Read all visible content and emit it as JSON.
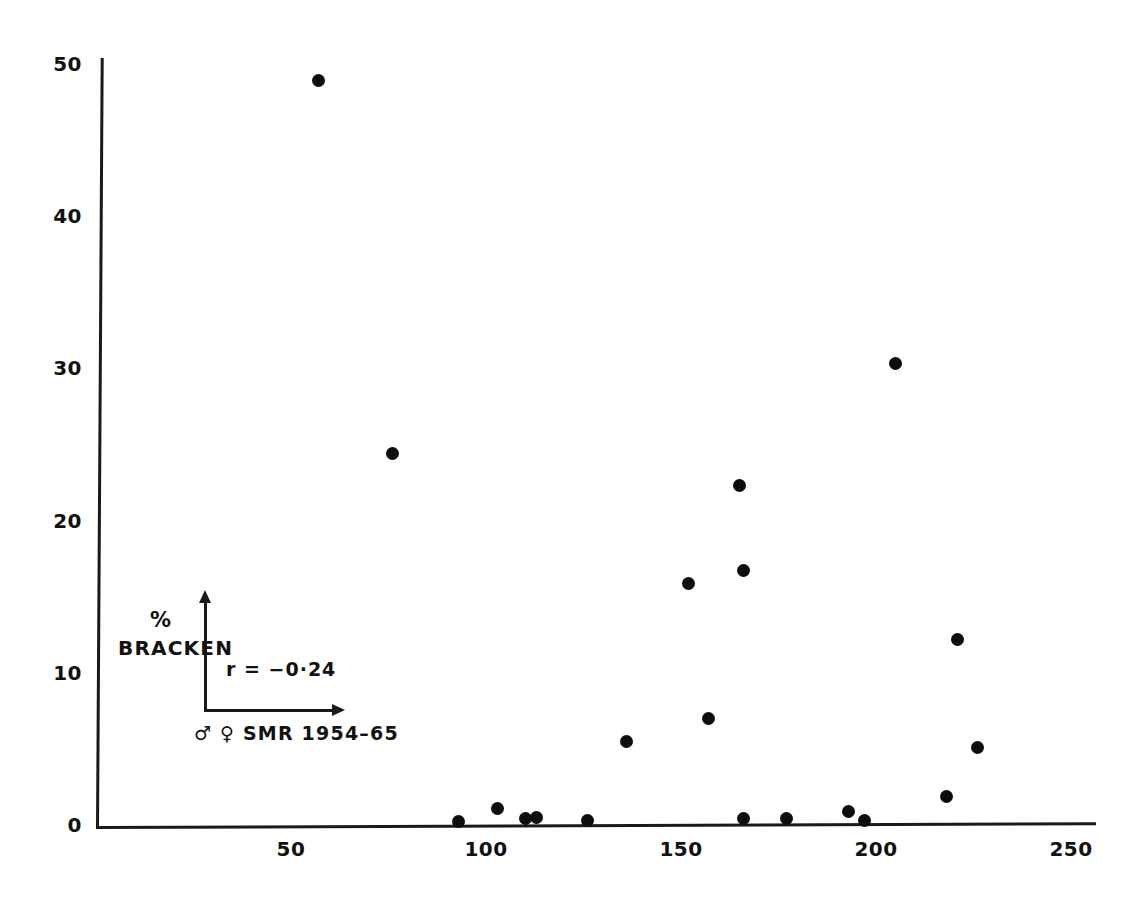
{
  "chart_data": {
    "type": "scatter",
    "title": "",
    "subtitle": "",
    "xlabel": "♂ ♀  SMR  1954–65",
    "ylabel": "% BRACKEN",
    "ylabel_lines": [
      "%",
      "BRACKEN"
    ],
    "annotation": "r = −0·24",
    "correlation": -0.24,
    "xlim": [
      0,
      255
    ],
    "ylim": [
      0,
      52
    ],
    "xticks": [
      50,
      100,
      150,
      200,
      250
    ],
    "yticks": [
      0,
      10,
      20,
      30,
      40,
      50
    ],
    "xtick_labels": [
      "50",
      "100",
      "150",
      "200",
      "250"
    ],
    "ytick_labels": [
      "0",
      "10",
      "20",
      "30",
      "40",
      "50"
    ],
    "grid": false,
    "legend": null,
    "marker": "filled-circle",
    "marker_color": "#0d0d0d",
    "axis_color": "#1a1a1a",
    "background_color": "#ffffff",
    "points": [
      {
        "x": 57,
        "y": 48.9
      },
      {
        "x": 76,
        "y": 24.4
      },
      {
        "x": 93,
        "y": 0.2
      },
      {
        "x": 103,
        "y": 1.1
      },
      {
        "x": 110,
        "y": 0.4
      },
      {
        "x": 113,
        "y": 0.5
      },
      {
        "x": 126,
        "y": 0.3
      },
      {
        "x": 136,
        "y": 5.5
      },
      {
        "x": 152,
        "y": 15.9
      },
      {
        "x": 157,
        "y": 7.0
      },
      {
        "x": 165,
        "y": 22.3
      },
      {
        "x": 166,
        "y": 16.7
      },
      {
        "x": 166,
        "y": 0.4
      },
      {
        "x": 177,
        "y": 0.4
      },
      {
        "x": 193,
        "y": 0.9
      },
      {
        "x": 197,
        "y": 0.3
      },
      {
        "x": 205,
        "y": 30.3
      },
      {
        "x": 218,
        "y": 1.9
      },
      {
        "x": 221,
        "y": 12.2
      },
      {
        "x": 226,
        "y": 5.1
      }
    ]
  },
  "inset": {
    "y_axis_name": "vertical-axis-arrow",
    "x_axis_name": "horizontal-axis-arrow"
  }
}
